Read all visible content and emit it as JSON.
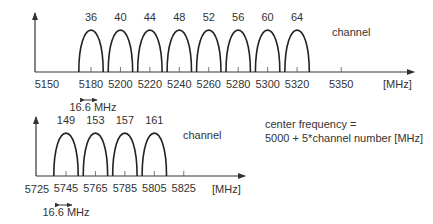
{
  "diagram": {
    "bands": [
      {
        "id": "lower",
        "unit_label": "[MHz]",
        "channel_label": "channel",
        "bandwidth_label": "16.6 MHz",
        "axis_start_label": "5150",
        "channels": [
          {
            "number": "36",
            "center": 5180
          },
          {
            "number": "40",
            "center": 5200
          },
          {
            "number": "44",
            "center": 5220
          },
          {
            "number": "48",
            "center": 5240
          },
          {
            "number": "52",
            "center": 5260
          },
          {
            "number": "56",
            "center": 5280
          },
          {
            "number": "60",
            "center": 5300
          },
          {
            "number": "64",
            "center": 5320
          }
        ],
        "extra_ticks": [
          5350
        ]
      },
      {
        "id": "upper",
        "unit_label": "[MHz]",
        "channel_label": "channel",
        "bandwidth_label": "16.6 MHz",
        "axis_start_label": "5725",
        "channels": [
          {
            "number": "149",
            "center": 5745
          },
          {
            "number": "153",
            "center": 5765
          },
          {
            "number": "157",
            "center": 5785
          },
          {
            "number": "161",
            "center": 5805
          }
        ],
        "extra_ticks": [
          5825
        ]
      }
    ],
    "formula_line1": "center frequency =",
    "formula_line2": "5000 + 5*channel number [MHz]"
  }
}
